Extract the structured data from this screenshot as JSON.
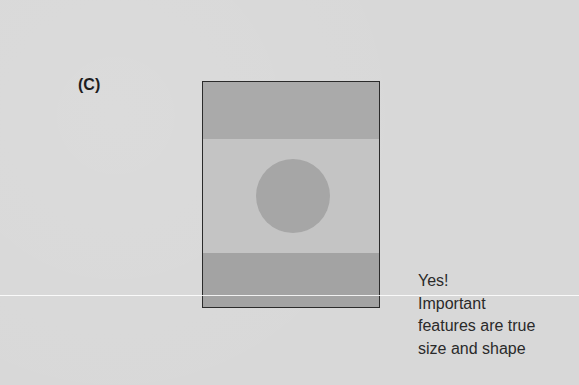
{
  "panel_label": "(C)",
  "figure": {
    "colors": {
      "background": "#d8d8d8",
      "rect_fill": "#c4c4c4",
      "band": "#a8a8a8",
      "circle": "#a6a6a6",
      "border": "#2b2b2b"
    }
  },
  "caption": {
    "lines": [
      "Yes!",
      "Important",
      "features are true",
      "size and shape"
    ]
  }
}
